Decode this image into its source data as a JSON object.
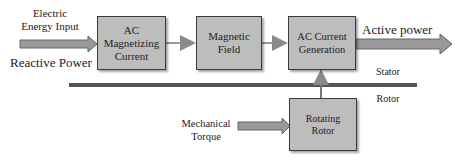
{
  "diagram": {
    "inputs": {
      "electric_energy_input": "Electric\nEnergy Input",
      "reactive_power": "Reactive Power",
      "mechanical_torque": "Mechanical\nTorque"
    },
    "blocks": [
      {
        "id": "ac-magnetizing-current",
        "label": "AC\nMagnetizing\nCurrent"
      },
      {
        "id": "magnetic-field",
        "label": "Magnetic\nField"
      },
      {
        "id": "ac-current-generation",
        "label": "AC Current\nGeneration"
      },
      {
        "id": "rotating-rotor",
        "label": "Rotating\nRotor"
      }
    ],
    "output": {
      "active_power": "Active power"
    },
    "divider": {
      "stator": "Stator",
      "rotor": "Rotor"
    },
    "colors": {
      "block_fill": "#bdbdbd",
      "block_border": "#3a3a3a",
      "arrow_fill": "#8c8c8c",
      "line": "#555555"
    }
  }
}
